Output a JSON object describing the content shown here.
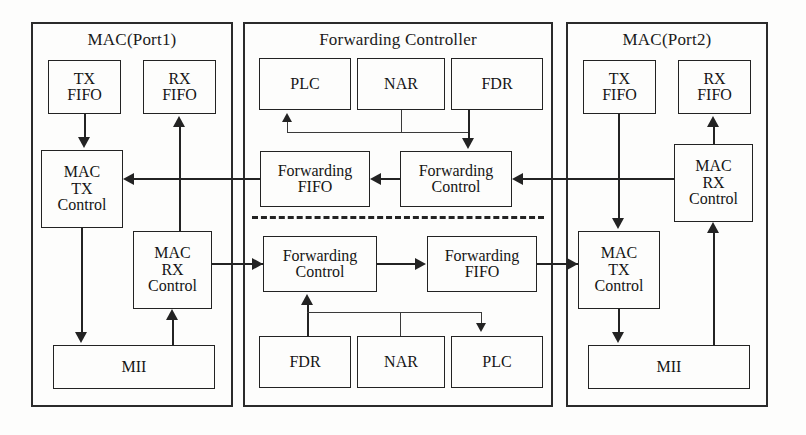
{
  "diagram": {
    "panels": {
      "left": {
        "title": "MAC(Port1)"
      },
      "middle": {
        "title": "Forwarding Controller"
      },
      "right": {
        "title": "MAC(Port2)"
      }
    },
    "blocks": {
      "left_tx_fifo": "TX\nFIFO",
      "left_rx_fifo": "RX\nFIFO",
      "left_mac_tx_control": "MAC\nTX\nControl",
      "left_mac_rx_control": "MAC\nRX\nControl",
      "left_mii": "MII",
      "mid_top_plc": "PLC",
      "mid_top_nar": "NAR",
      "mid_top_fdr": "FDR",
      "mid_top_fwd_fifo": "Forwarding\nFIFO",
      "mid_top_fwd_control": "Forwarding\nControl",
      "mid_bot_fwd_control": "Forwarding\nControl",
      "mid_bot_fwd_fifo": "Forwarding\nFIFO",
      "mid_bot_fdr": "FDR",
      "mid_bot_nar": "NAR",
      "mid_bot_plc": "PLC",
      "right_tx_fifo": "TX\nFIFO",
      "right_rx_fifo": "RX\nFIFO",
      "right_mac_rx_control": "MAC\nRX\nControl",
      "right_mac_tx_control": "MAC\nTX\nControl",
      "right_mii": "MII"
    },
    "colors": {
      "stroke": "#232323",
      "panel_stroke": "#2b2b2b",
      "background": "#fdfdfc",
      "text": "#151515"
    }
  }
}
